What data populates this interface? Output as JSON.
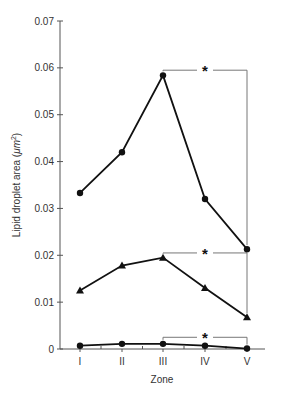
{
  "chart_data": {
    "type": "line",
    "title": "",
    "xlabel": "Zone",
    "ylabel": "Lipid droplet area (μm²)",
    "ylabel_parts": {
      "main": "Lipid droplet area (",
      "unit": "μm",
      "sup": "2",
      "close": ")"
    },
    "categories": [
      "I",
      "II",
      "III",
      "IV",
      "V"
    ],
    "ylim": [
      0,
      0.07
    ],
    "yticks": [
      0,
      0.01,
      0.02,
      0.03,
      0.04,
      0.05,
      0.06,
      0.07
    ],
    "ytick_labels": [
      "0",
      "0.01",
      "0.02",
      "0.03",
      "0.04",
      "0.05",
      "0.06",
      "0.07"
    ],
    "grid": false,
    "legend": null,
    "series": [
      {
        "name": "Series 1 (circles, upper)",
        "marker": "circle",
        "values": [
          0.0333,
          0.042,
          0.0584,
          0.032,
          0.0213
        ]
      },
      {
        "name": "Series 2 (triangles)",
        "marker": "triangle",
        "values": [
          0.0125,
          0.0178,
          0.0195,
          0.013,
          0.0068
        ]
      },
      {
        "name": "Series 3 (circles, lower)",
        "marker": "circle",
        "values": [
          0.0007,
          0.0011,
          0.0011,
          0.0007,
          0.0001
        ]
      }
    ],
    "annotations": [
      {
        "type": "significance-bracket",
        "label": "*",
        "from": "III",
        "to": "V",
        "series": 0,
        "y": 0.0595
      },
      {
        "type": "significance-bracket",
        "label": "*",
        "from": "III",
        "to": "V",
        "series": 1,
        "y": 0.0205
      },
      {
        "type": "significance-bracket",
        "label": "*",
        "from": "III",
        "to": "V",
        "series": 2,
        "y": 0.0025
      }
    ]
  },
  "colors": {
    "line": "#111111",
    "axis": "#555555",
    "bracket": "#777777"
  }
}
